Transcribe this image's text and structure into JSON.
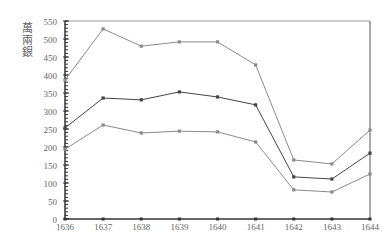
{
  "chart_data": {
    "type": "line",
    "title": "",
    "xlabel": "",
    "ylabel": "萬兩銀",
    "ylim": [
      0,
      550
    ],
    "yticks": [
      0,
      50,
      100,
      150,
      200,
      250,
      300,
      350,
      400,
      450,
      500,
      550
    ],
    "categories": [
      "1636",
      "1637",
      "1638",
      "1639",
      "1640",
      "1641",
      "1642",
      "1643",
      "1644"
    ],
    "series": [
      {
        "name": "upper",
        "color": "#8a8a8a",
        "values": [
          386,
          528,
          480,
          492,
          492,
          428,
          164,
          153,
          247
        ]
      },
      {
        "name": "middle",
        "color": "#444444",
        "values": [
          253,
          336,
          331,
          353,
          339,
          317,
          117,
          111,
          183
        ]
      },
      {
        "name": "lower",
        "color": "#8a8a8a",
        "values": [
          194,
          261,
          239,
          244,
          242,
          214,
          81,
          75,
          125
        ]
      }
    ],
    "grid": false,
    "legend": "none"
  }
}
